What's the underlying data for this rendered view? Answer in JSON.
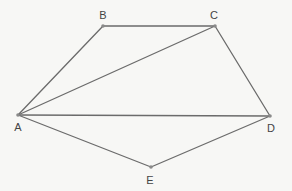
{
  "diagram": {
    "type": "geometry-figure",
    "vertices": [
      {
        "id": "A",
        "label": "A",
        "x": 18,
        "y": 115,
        "lx": 18,
        "ly": 131
      },
      {
        "id": "B",
        "label": "B",
        "x": 103,
        "y": 26,
        "lx": 103,
        "ly": 19
      },
      {
        "id": "C",
        "label": "C",
        "x": 215,
        "y": 26,
        "lx": 214,
        "ly": 19
      },
      {
        "id": "D",
        "label": "D",
        "x": 270,
        "y": 116,
        "lx": 271,
        "ly": 132
      },
      {
        "id": "E",
        "label": "E",
        "x": 151,
        "y": 167,
        "lx": 150,
        "ly": 184
      }
    ],
    "edges": [
      [
        "A",
        "B"
      ],
      [
        "B",
        "C"
      ],
      [
        "C",
        "D"
      ],
      [
        "A",
        "C"
      ],
      [
        "A",
        "D"
      ],
      [
        "A",
        "E"
      ],
      [
        "E",
        "D"
      ]
    ],
    "colors": {
      "line": "#6b6b6b",
      "vertex": "#8a8a8a",
      "label": "#444444",
      "background": "#f7f7f5"
    }
  }
}
